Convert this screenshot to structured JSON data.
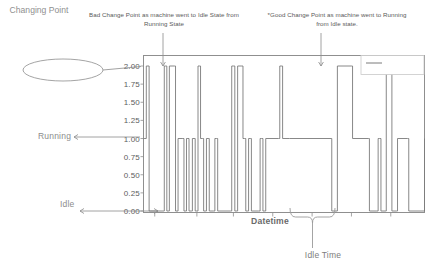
{
  "figure": {
    "axis_x_label": "Datetime",
    "legend_entry": "State",
    "callout_changing_point": "Changing Point",
    "label_running": "Running",
    "label_idle": "Idle",
    "label_idle_time": "Idle Time",
    "annotation_bad": "Bad Change Point as machine went to Idle State from Running State",
    "annotation_good": "*Good Change Point as machine went to Running from Idle state.",
    "colors": {
      "line": "#7a7a7a",
      "axis": "#909090",
      "annotation_text": "#5a5a5a",
      "tick_text": "#5d5d5d",
      "callout_text": "#8f8f8f",
      "background": "#ffffff"
    }
  },
  "chart_data": {
    "type": "line",
    "title": "",
    "subtitle": "",
    "xlabel": "Datetime",
    "ylabel": "",
    "grid": false,
    "legend_position": "upper right",
    "xlim": [
      0,
      100
    ],
    "ylim": [
      0.0,
      2.0
    ],
    "yticks": [
      "0.00",
      "0.25",
      "0.50",
      "0.75",
      "1.00",
      "1.25",
      "1.50",
      "1.75",
      "2.00"
    ],
    "ytick_values": [
      0.0,
      0.25,
      0.5,
      0.75,
      1.0,
      1.25,
      1.5,
      1.75,
      2.0
    ],
    "xticks": [],
    "xtick_positions": [
      4,
      19,
      32,
      46,
      60,
      74,
      88
    ],
    "state_encoding": {
      "0": "Idle",
      "1": "Running",
      "2": "Changing Point"
    },
    "annotations": [
      {
        "text": "Bad Change Point as machine went to Idle State from Running State",
        "arrow_x": 8,
        "arrow_to_y": 2.0
      },
      {
        "text": "*Good Change Point as machine went to Running from Idle state.",
        "arrow_x": 63,
        "arrow_to_y": 2.0
      }
    ],
    "brace_region": {
      "label": "Idle Time",
      "x_start": 52,
      "x_end": 67
    },
    "series": [
      {
        "name": "State",
        "x": [
          0.0,
          0.5,
          1.0,
          1.6,
          2.0,
          2.6,
          7.0,
          7.4,
          7.9,
          8.3,
          8.8,
          9.2,
          11.0,
          11.4,
          11.9,
          12.3,
          14.0,
          14.4,
          14.9,
          15.3,
          15.8,
          16.2,
          17.0,
          17.4,
          18.0,
          18.4,
          19.0,
          19.4,
          19.9,
          20.3,
          21.0,
          21.4,
          22.0,
          22.4,
          23.0,
          23.4,
          25.0,
          25.4,
          26.0,
          26.4,
          31.0,
          31.4,
          32.0,
          32.5,
          33.0,
          33.5,
          35.0,
          35.4,
          36.0,
          36.4,
          37.0,
          37.4,
          38.0,
          38.4,
          41.0,
          41.5,
          42.0,
          42.5,
          43.0,
          43.5,
          48.0,
          48.5,
          49.0,
          49.5,
          52.0,
          67.0,
          68.5,
          69.0,
          74.0,
          74.4,
          80.0,
          80.4,
          83.0,
          83.5,
          84.0,
          84.5,
          86.0,
          86.4,
          88.0,
          88.4,
          90.0,
          90.4,
          94.0,
          94.4,
          100.0
        ],
        "y": [
          1,
          1,
          2,
          2,
          0,
          0,
          0,
          2,
          2,
          0,
          0,
          2,
          2,
          0,
          0,
          1,
          1,
          0,
          0,
          1,
          1,
          0,
          0,
          1,
          1,
          0,
          0,
          2,
          2,
          1,
          1,
          0,
          0,
          1,
          1,
          0,
          0,
          1,
          1,
          0,
          0,
          2,
          2,
          0,
          0,
          2,
          2,
          1,
          1,
          0,
          0,
          1,
          1,
          0,
          0,
          1,
          1,
          0,
          0,
          1,
          1,
          2,
          2,
          1,
          1,
          0,
          0,
          2,
          2,
          1,
          1,
          0,
          0,
          1,
          1,
          0,
          0,
          2,
          2,
          0,
          0,
          1,
          1,
          0,
          1
        ]
      }
    ]
  }
}
